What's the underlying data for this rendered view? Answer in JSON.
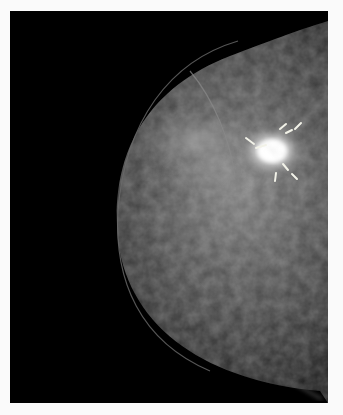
{
  "image": {
    "subject": "mammogram",
    "view": "craniocaudal breast X-ray",
    "background_color": "#000000",
    "border_color": "#fafafa",
    "annotations": {
      "type": "radial tick markers",
      "count": 8,
      "target": "spiculated bright mass",
      "marker_color": "#f2f2e8"
    }
  }
}
